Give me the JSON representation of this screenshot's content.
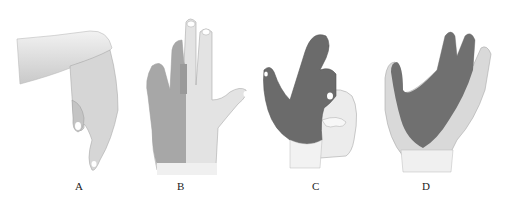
{
  "figure": {
    "panels": [
      {
        "id": "A",
        "label": "A",
        "depiction": "hand-wrist-drop-side-view"
      },
      {
        "id": "B",
        "label": "B",
        "depiction": "hand-dorsal-view-ulnar-half-shaded"
      },
      {
        "id": "C",
        "label": "C",
        "depiction": "hand-palmar-view-radial-shaded-claw"
      },
      {
        "id": "D",
        "label": "D",
        "depiction": "hand-palmar-view-median-area-shaded"
      }
    ],
    "colors": {
      "skin_light": "#e6e6e6",
      "skin_mid": "#cfcfcf",
      "shaded_region": "#6e6e6e",
      "shaded_region_light": "#a8a8a8",
      "nail": "#ffffff",
      "outline": "#9a9a9a"
    }
  }
}
